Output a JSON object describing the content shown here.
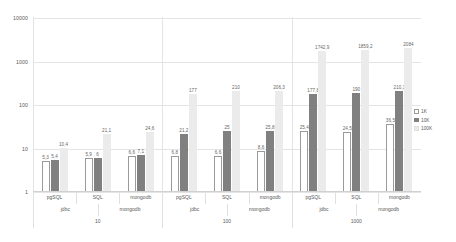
{
  "chart_data": {
    "type": "bar",
    "title": "",
    "xlabel": "",
    "ylabel": "",
    "yscale": "log",
    "ylim": [
      1,
      10000
    ],
    "yticks": [
      "1",
      "10",
      "100",
      "1000",
      "10000"
    ],
    "grid": true,
    "legend_position": "right",
    "legend": [
      "1K",
      "10K",
      "100K"
    ],
    "axis_tiers": {
      "tier1": [
        "pgSQL",
        "SQL",
        "mongodb",
        "pgSQL",
        "SQL",
        "mongodb",
        "pgSQL",
        "SQL",
        "mongodb"
      ],
      "tier2": [
        "jdbc",
        "mongodb",
        "jdbc",
        "mongodb",
        "jdbc",
        "mongodb"
      ],
      "tier3": [
        "10",
        "100",
        "1000"
      ]
    },
    "categories": [
      "10 / jdbc / pgSQL",
      "10 / jdbc / SQL",
      "10 / mongodb",
      "100 / jdbc / pgSQL",
      "100 / jdbc / SQL",
      "100 / mongodb",
      "1000 / jdbc / pgSQL",
      "1000 / jdbc / SQL",
      "1000 / mongodb"
    ],
    "series": [
      {
        "name": "1K",
        "values": [
          5.3,
          5.9,
          6.6,
          6.8,
          6.6,
          8.6,
          25.4,
          24.5,
          36.5
        ],
        "labels": [
          "5,3",
          "5,9",
          "6,6",
          "6,8",
          "6,6",
          "8,6",
          "25,4",
          "24,5",
          "36,5"
        ]
      },
      {
        "name": "10K",
        "values": [
          5.4,
          6,
          7.1,
          21.2,
          25,
          25.8,
          177.8,
          190,
          210.1
        ],
        "labels": [
          "5,4",
          "6",
          "7,1",
          "21,2",
          "25",
          "25,8",
          "177,8",
          "190",
          "210,1"
        ]
      },
      {
        "name": "100K",
        "values": [
          10.4,
          21.1,
          24.6,
          177,
          210,
          206.3,
          1742.9,
          1859.2,
          2084
        ],
        "labels": [
          "10,4",
          "21,1",
          "24,6",
          "177",
          "210",
          "206,3",
          "1742,9",
          "1859,2",
          "2084"
        ]
      }
    ]
  },
  "colors": {
    "series_1k": "#ffffff",
    "series_1k_border": "#9a9a9a",
    "series_10k": "#808080",
    "series_100k": "#ebebeb",
    "gridline": "#e4e4e4",
    "text": "#5a5a5a"
  }
}
